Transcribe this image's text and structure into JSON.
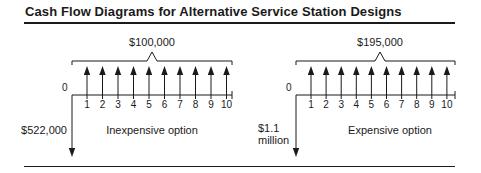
{
  "title": "Cash Flow Diagrams for Alternative Service Station Designs",
  "diagrams": [
    {
      "name": "inexpensive",
      "label": "Inexpensive option",
      "annual_benefit_label": "$100,000",
      "initial_cost_label": [
        "$522,000"
      ],
      "periods": [
        "0",
        "1",
        "2",
        "3",
        "4",
        "5",
        "6",
        "7",
        "8",
        "9",
        "10"
      ],
      "origin_x": 72,
      "end_x": 232,
      "arrow_start_x": 87,
      "arrow_step": 15.5,
      "bracket_peak_x": 152,
      "cost_label_x": 67,
      "label_x": 152
    },
    {
      "name": "expensive",
      "label": "Expensive option",
      "annual_benefit_label": "$195,000",
      "initial_cost_label": [
        "$1.1",
        "million"
      ],
      "periods": [
        "0",
        "1",
        "2",
        "3",
        "4",
        "5",
        "6",
        "7",
        "8",
        "9",
        "10"
      ],
      "origin_x": 296,
      "end_x": 455,
      "arrow_start_x": 311,
      "arrow_step": 15.1,
      "bracket_peak_x": 380,
      "cost_label_x": 258,
      "label_x": 390
    }
  ],
  "chart_data": {
    "type": "cash_flow_diagram",
    "title": "Cash Flow Diagrams for Alternative Service Station Designs",
    "series": [
      {
        "name": "Inexpensive option",
        "initial_outflow": 522000,
        "annual_inflow": 100000,
        "periods": [
          1,
          2,
          3,
          4,
          5,
          6,
          7,
          8,
          9,
          10
        ]
      },
      {
        "name": "Expensive option",
        "initial_outflow": 1100000,
        "annual_inflow": 195000,
        "periods": [
          1,
          2,
          3,
          4,
          5,
          6,
          7,
          8,
          9,
          10
        ]
      }
    ],
    "xlabel": "Year",
    "x": [
      0,
      1,
      2,
      3,
      4,
      5,
      6,
      7,
      8,
      9,
      10
    ]
  }
}
